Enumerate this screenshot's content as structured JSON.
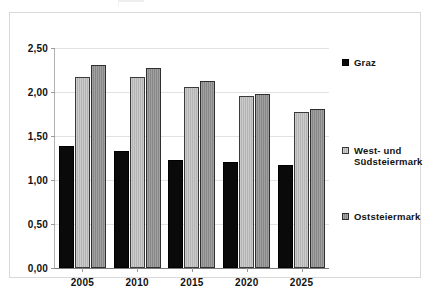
{
  "chart_data": {
    "type": "bar",
    "title": "",
    "subtitle": "",
    "xlabel": "",
    "ylabel": "",
    "categories": [
      "2005",
      "2010",
      "2015",
      "2020",
      "2025"
    ],
    "series": [
      {
        "name": "Graz",
        "legend_swatch": "black-square",
        "color": "#0a0a0a",
        "values": [
          1.39,
          1.33,
          1.23,
          1.2,
          1.17
        ]
      },
      {
        "name": "West- und\nSüdsteiermark",
        "legend_swatch": "light-gray-square",
        "color": "#b4b4b4",
        "values": [
          2.17,
          2.17,
          2.06,
          1.95,
          1.77
        ]
      },
      {
        "name": "Oststeiermark",
        "legend_swatch": "dark-gray-square",
        "color": "#878787",
        "values": [
          2.31,
          2.27,
          2.12,
          1.98,
          1.81
        ]
      }
    ],
    "ylim": [
      0.0,
      2.5
    ],
    "ytick_values": [
      0.0,
      0.5,
      1.0,
      1.5,
      2.0,
      2.5
    ],
    "ytick_labels": [
      "0,00",
      "0,50",
      "1,00",
      "1,50",
      "2,00",
      "2,50"
    ],
    "grid": true,
    "legend_position": "right",
    "decimal_separator": ","
  },
  "axes": {
    "y_labels": [
      "2,50",
      "2,00",
      "1,50",
      "1,00",
      "0,50",
      "0,00"
    ],
    "x_labels": [
      "2005",
      "2010",
      "2015",
      "2020",
      "2025"
    ]
  },
  "legend": {
    "entries": [
      {
        "label": "Graz"
      },
      {
        "label": "West- und\nSüdsteiermark"
      },
      {
        "label": "Oststeiermark"
      }
    ]
  },
  "colors": {
    "graz": "#0a0a0a",
    "west_und_suedsteiermark": "#b4b4b4",
    "oststeiermark": "#878787",
    "grid": "#e2e2e2",
    "axis": "#9a9a9a",
    "frame": "#d9d9d9",
    "background": "#ffffff"
  }
}
